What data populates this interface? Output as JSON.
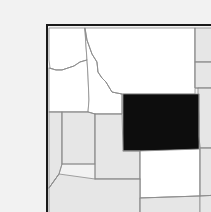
{
  "figure": {
    "kind": "locator-map",
    "title": "Locator map of the western United States with Wyoming highlighted",
    "caption": "",
    "background_color": "#f2f2f2",
    "frame_color": "#1a1a1a",
    "frame": {
      "x": 7,
      "y": 9,
      "width": 195,
      "height": 192,
      "stroke_width": 2
    }
  },
  "legend": {
    "highlight_label": "Wyoming",
    "highlight_color": "#0d0d0d",
    "region_label": "Neighboring states",
    "region_color": "#ffffff",
    "outer_label": "Surrounding states",
    "outer_color": "#e6e6e6",
    "border_color": "#8c8c8c",
    "border_width": 0.8
  },
  "map": {
    "projection_note": "simplified political outlines",
    "states": [
      {
        "name": "Washington",
        "abbr": "WA",
        "fill": "#ffffff",
        "highlighted": false,
        "path": "M9,12 L45,12 L45,16 L46,30 L47,44 L40,46 L34,50 L28,52 L22,54 L16,54 L10,52 L9,44 Z"
      },
      {
        "name": "Oregon",
        "abbr": "OR",
        "fill": "#ffffff",
        "highlighted": false,
        "path": "M9,52 L16,54 L22,54 L28,52 L34,50 L40,46 L47,44 L48,60 L49,84 L48,96 L12,96 L9,96 Z"
      },
      {
        "name": "California (north)",
        "abbr": "CA",
        "fill": "#e6e6e6",
        "highlighted": false,
        "path": "M9,96 L22,96 L22,148 L19,158 L9,172 Z"
      },
      {
        "name": "Idaho",
        "abbr": "ID",
        "fill": "#ffffff",
        "highlighted": false,
        "path": "M45,12 L46,30 L47,44 L48,60 L49,84 L48,96 L55,98 L82,98 L82,78 L72,76 L66,66 L62,62 L58,56 L57,46 L52,38 L47,24 L45,14 Z"
      },
      {
        "name": "Montana",
        "abbr": "MT",
        "fill": "#ffffff",
        "highlighted": false,
        "path": "M45,12 L155,12 L155,30 L155,78 L83,78 L82,78 L72,76 L66,66 L62,62 L58,56 L57,46 L52,38 L47,24 Z"
      },
      {
        "name": "North Dakota",
        "abbr": "ND",
        "fill": "#e6e6e6",
        "highlighted": false,
        "path": "M155,12 L200,12 L200,46 L155,46 Z"
      },
      {
        "name": "South Dakota",
        "abbr": "SD",
        "fill": "#e6e6e6",
        "highlighted": false,
        "path": "M155,46 L200,46 L200,72 L158,72 L155,72 Z"
      },
      {
        "name": "Nebraska",
        "abbr": "NE",
        "fill": "#e6e6e6",
        "highlighted": false,
        "path": "M158,72 L200,72 L200,132 L160,132 L159,120 L159,100 L158,86 Z"
      },
      {
        "name": "Wyoming",
        "abbr": "WY",
        "fill": "#0d0d0d",
        "highlighted": true,
        "path": "M83,78 L159,78 L159,135 L83,135 Z"
      },
      {
        "name": "Nevada",
        "abbr": "NV",
        "fill": "#e6e6e6",
        "highlighted": false,
        "path": "M22,96 L48,96 L55,98 L55,148 L22,148 Z"
      },
      {
        "name": "Utah",
        "abbr": "UT",
        "fill": "#e6e6e6",
        "highlighted": false,
        "path": "M55,98 L82,98 L83,135 L100,135 L100,163 L55,163 L55,148 Z"
      },
      {
        "name": "Colorado",
        "abbr": "CO",
        "fill": "#ffffff",
        "highlighted": false,
        "path": "M100,135 L160,133 L160,180 L100,182 Z"
      },
      {
        "name": "Arizona",
        "abbr": "AZ",
        "fill": "#e6e6e6",
        "highlighted": false,
        "path": "M19,158 L9,172 L9,200 L100,200 L100,182 L100,163 L55,163 Z"
      },
      {
        "name": "New Mexico",
        "abbr": "NM",
        "fill": "#e6e6e6",
        "highlighted": false,
        "path": "M100,182 L160,180 L160,200 L100,200 Z"
      },
      {
        "name": "Kansas",
        "abbr": "KS",
        "fill": "#e6e6e6",
        "highlighted": false,
        "path": "M160,132 L200,132 L200,178 L160,180 Z"
      },
      {
        "name": "Oklahoma / Texas panhandle",
        "abbr": "OK",
        "fill": "#e6e6e6",
        "highlighted": false,
        "path": "M160,180 L200,178 L200,200 L160,200 Z"
      }
    ],
    "internal_borders": [
      {
        "name": "wa-or-border",
        "path": "M9,52 L16,54 L22,54 L28,52 L34,50 L40,46 L47,44"
      },
      {
        "name": "or-nv-ca-border",
        "path": "M9,96 L22,96 L48,96 L55,98"
      },
      {
        "name": "id-wa-or-border",
        "path": "M45,12 L47,24 L52,38 L57,46 L58,56 L62,62 L66,66 L72,76 L82,78"
      },
      {
        "name": "id-mt-eastline",
        "path": "M82,78 L82,98 L55,98"
      },
      {
        "name": "ca-nv-border",
        "path": "M22,96 L22,148 L19,158 L9,172"
      },
      {
        "name": "nv-ut-border",
        "path": "M55,98 L55,148 L55,163"
      },
      {
        "name": "nv-az-border",
        "path": "M22,148 L55,148"
      },
      {
        "name": "ut-az-border",
        "path": "M55,163 L100,163"
      },
      {
        "name": "az-nm-border",
        "path": "M100,163 L100,182 L100,200"
      },
      {
        "name": "ut-co-border",
        "path": "M83,135 L100,135 L100,163"
      },
      {
        "name": "co-nm-border",
        "path": "M100,182 L160,180"
      },
      {
        "name": "co-ks-ne-border",
        "path": "M160,133 L160,180"
      },
      {
        "name": "mt-nd-sd-border",
        "path": "M155,12 L155,46 L155,72 L158,72"
      },
      {
        "name": "nd-sd-border",
        "path": "M155,46 L200,46"
      },
      {
        "name": "sd-ne-border",
        "path": "M158,72 L200,72"
      },
      {
        "name": "ne-ks-border",
        "path": "M160,132 L200,132"
      },
      {
        "name": "ks-ok-border",
        "path": "M160,180 L200,178"
      },
      {
        "name": "wy-ne-edge",
        "path": "M159,78 L159,100 L159,120 L160,132"
      },
      {
        "name": "az-ca-corner",
        "path": "M19,158 L9,172"
      }
    ]
  }
}
